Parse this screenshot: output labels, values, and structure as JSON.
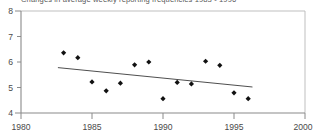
{
  "figure": {
    "title": "Changes in average weekly reporting frequencies 1983 - 1996",
    "title_visible_note": "cropped at top edge"
  },
  "chart_data": {
    "type": "scatter",
    "title": "Changes in average weekly reporting frequencies 1983 - 1996",
    "xlabel": "",
    "ylabel": "",
    "xlim": [
      1980,
      2000
    ],
    "ylim": [
      4,
      8
    ],
    "xticks": [
      1980,
      1985,
      1990,
      1995,
      2000
    ],
    "yticks": [
      4,
      5,
      6,
      7,
      8
    ],
    "xtick_labels": [
      "1980",
      "1985",
      "1990",
      "1995",
      "2000"
    ],
    "ytick_labels": [
      "4",
      "5",
      "6",
      "7",
      "8"
    ],
    "grid": false,
    "legend": null,
    "marker": "diamond",
    "x": [
      1983,
      1984,
      1985,
      1986,
      1987,
      1988,
      1989,
      1990,
      1991,
      1992,
      1993,
      1994,
      1995,
      1996
    ],
    "values": [
      6.36,
      6.17,
      5.22,
      4.87,
      5.17,
      5.89,
      6.0,
      4.56,
      5.2,
      5.14,
      6.03,
      5.87,
      4.79,
      4.56
    ],
    "series": [
      {
        "name": "average weekly reporting frequency",
        "x": [
          1983,
          1984,
          1985,
          1986,
          1987,
          1988,
          1989,
          1990,
          1991,
          1992,
          1993,
          1994,
          1995,
          1996
        ],
        "values": [
          6.36,
          6.17,
          5.22,
          4.87,
          5.17,
          5.89,
          6.0,
          4.56,
          5.2,
          5.14,
          6.03,
          5.87,
          4.79,
          4.56
        ]
      }
    ],
    "trendline": {
      "type": "linear",
      "x": [
        1982.6,
        1996.3
      ],
      "y": [
        5.78,
        5.02
      ]
    }
  }
}
